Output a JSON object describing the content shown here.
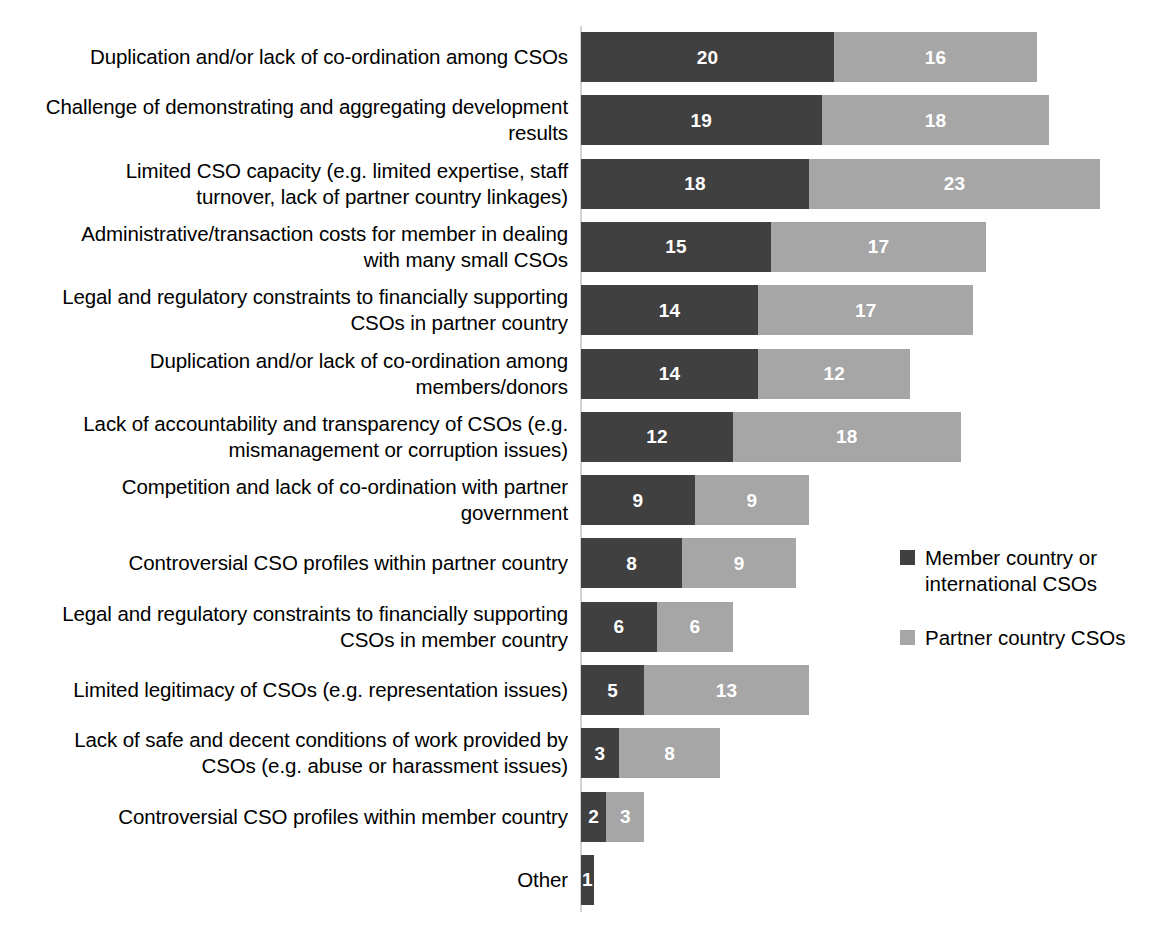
{
  "chart_data": {
    "type": "bar",
    "orientation": "horizontal",
    "stacked": true,
    "title": "",
    "subtitle": "",
    "xlabel": "",
    "ylabel": "",
    "grid": false,
    "axis": {
      "x_axis_visible": false,
      "x_tick_labels": [],
      "xlim": [
        0,
        41
      ],
      "category_axis_line": true
    },
    "legend": {
      "position": "right",
      "entries": [
        {
          "label": "Member country or international CSOs",
          "color": "#404040"
        },
        {
          "label": "Partner country CSOs",
          "color": "#a6a6a6"
        }
      ]
    },
    "categories": [
      "Duplication and/or lack of co-ordination among CSOs",
      "Challenge of demonstrating and aggregating development results",
      "Limited CSO capacity (e.g. limited expertise, staff turnover, lack of partner country linkages)",
      "Administrative/transaction costs for member in dealing with many small CSOs",
      "Legal and regulatory constraints to financially supporting CSOs in partner country",
      "Duplication and/or lack of co-ordination among members/donors",
      "Lack of accountability and transparency of CSOs (e.g. mismanagement or corruption issues)",
      "Competition and lack of co-ordination with partner government",
      "Controversial CSO profiles within partner country",
      "Legal and regulatory constraints to financially supporting CSOs in member country",
      "Limited legitimacy of CSOs (e.g. representation issues)",
      "Lack of safe and decent conditions of work provided by CSOs (e.g. abuse or harassment issues)",
      "Controversial CSO profiles within member country",
      "Other"
    ],
    "series": [
      {
        "name": "Member country or international CSOs",
        "color": "#404040",
        "values": [
          20,
          19,
          18,
          15,
          14,
          14,
          12,
          9,
          8,
          6,
          5,
          3,
          2,
          1
        ]
      },
      {
        "name": "Partner country CSOs",
        "color": "#a6a6a6",
        "values": [
          16,
          18,
          23,
          17,
          17,
          12,
          18,
          9,
          9,
          6,
          13,
          8,
          3,
          0
        ]
      }
    ],
    "totals": [
      36,
      37,
      41,
      32,
      31,
      26,
      30,
      18,
      17,
      12,
      18,
      11,
      5,
      1
    ],
    "data_labels_shown": true
  },
  "style": {
    "background": "#ffffff",
    "text_color": "#000000",
    "axis_line_color": "#d2d2d2",
    "data_label_color": "#ffffff"
  }
}
